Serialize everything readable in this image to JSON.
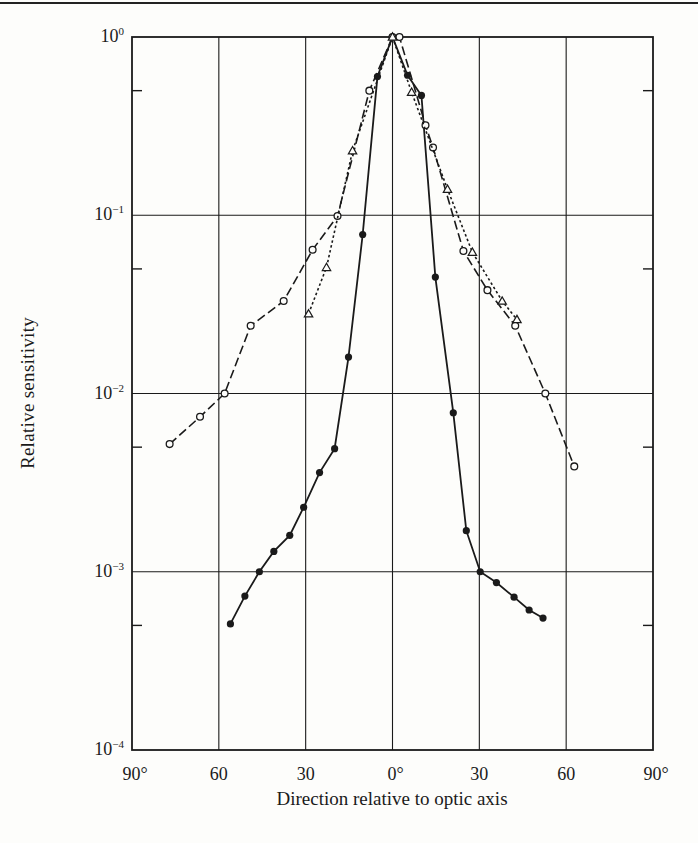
{
  "chart_data": {
    "type": "line",
    "title": "",
    "xlabel": "Direction relative to optic axis",
    "ylabel": "Relative sensitivity",
    "xlim": [
      -90,
      90
    ],
    "ylim": [
      0.0001,
      1
    ],
    "yscale": "log",
    "grid": true,
    "legend": null,
    "x_tick_labels": [
      "90°",
      "60",
      "30",
      "0°",
      "30",
      "60",
      "90°"
    ],
    "x_tick_values": [
      -90,
      -60,
      -30,
      0,
      30,
      60,
      90
    ],
    "y_tick_labels": [
      {
        "base": "10",
        "exp": "0"
      },
      {
        "base": "10",
        "exp": "−1"
      },
      {
        "base": "10",
        "exp": "−2"
      },
      {
        "base": "10",
        "exp": "−3"
      },
      {
        "base": "10",
        "exp": "−4"
      }
    ],
    "y_tick_values": [
      1,
      0.1,
      0.01,
      0.001,
      0.0001
    ],
    "series": [
      {
        "name": "filled-circles",
        "marker": "filled-circle",
        "line": "solid",
        "x": [
          -56,
          -51,
          -46,
          -41,
          -35.5,
          -30.7,
          -25.2,
          -20,
          -15.2,
          -10.3,
          -5.2,
          0,
          5.2,
          10,
          14.8,
          21,
          25.5,
          30.3,
          35.9,
          42,
          47.2,
          52
        ],
        "y": [
          0.00051,
          0.00073,
          0.001,
          0.0013,
          0.0016,
          0.0023,
          0.0036,
          0.0049,
          0.016,
          0.078,
          0.6,
          1.0,
          0.61,
          0.47,
          0.045,
          0.0078,
          0.0017,
          0.001,
          0.00087,
          0.00072,
          0.00061,
          0.00055
        ]
      },
      {
        "name": "open-circles",
        "marker": "open-circle",
        "line": "dashed",
        "x": [
          -77,
          -66.5,
          -58,
          -49,
          -37.6,
          -27.6,
          -19,
          -8,
          0,
          2.4,
          11.4,
          14,
          24.5,
          32.8,
          42.4,
          52.8,
          62.8
        ],
        "y": [
          0.0052,
          0.0074,
          0.01,
          0.024,
          0.033,
          0.064,
          0.099,
          0.5,
          1.0,
          1.0,
          0.32,
          0.24,
          0.063,
          0.038,
          0.024,
          0.01,
          0.0039
        ]
      },
      {
        "name": "open-triangles",
        "marker": "open-triangle",
        "line": "dotted",
        "x": [
          -29,
          -22.8,
          -13.8,
          0,
          6.6,
          19,
          27.6,
          37.9,
          43
        ],
        "y": [
          0.028,
          0.051,
          0.23,
          1.0,
          0.49,
          0.14,
          0.062,
          0.033,
          0.026
        ]
      }
    ]
  },
  "colors": {
    "ink": "#1a1a1a",
    "paper": "#fdfdfb"
  }
}
